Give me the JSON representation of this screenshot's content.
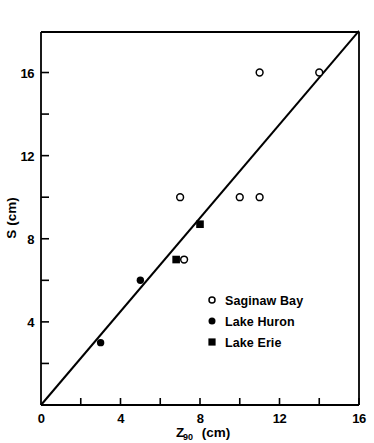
{
  "chart_data": {
    "type": "scatter",
    "title": "",
    "xlabel": "Z90 (cm)",
    "xlabel_main": "Z",
    "xlabel_sub": "90",
    "xlabel_unit": "(cm)",
    "ylabel": "S (cm)",
    "xlim": [
      0,
      16
    ],
    "ylim": [
      0,
      18
    ],
    "xticks_major": [
      0,
      4,
      8,
      12,
      16
    ],
    "xticks_minor": [
      2,
      6,
      10,
      14
    ],
    "xtick_labels": [
      "0",
      "4",
      "8",
      "12",
      "16"
    ],
    "yticks_major": [
      4,
      8,
      12,
      16
    ],
    "yticks_minor": [
      2,
      6,
      10,
      14,
      18
    ],
    "ytick_labels": [
      "4",
      "8",
      "12",
      "16"
    ],
    "grid": false,
    "legend_position": "inside-lower-right",
    "reference_line": {
      "name": "1:1 line",
      "x_start": 0,
      "y_start": 0,
      "x_end": 16,
      "y_end": 18
    },
    "series": [
      {
        "name": "Saginaw Bay",
        "marker": "open-circle",
        "color": "#000000",
        "points": [
          {
            "x": 7,
            "y": 10
          },
          {
            "x": 7.2,
            "y": 7
          },
          {
            "x": 10,
            "y": 10
          },
          {
            "x": 11,
            "y": 10
          },
          {
            "x": 11,
            "y": 16
          },
          {
            "x": 14,
            "y": 16
          }
        ]
      },
      {
        "name": "Lake Huron",
        "marker": "filled-circle",
        "color": "#000000",
        "points": [
          {
            "x": 3,
            "y": 3
          },
          {
            "x": 5,
            "y": 6
          }
        ]
      },
      {
        "name": "Lake Erie",
        "marker": "filled-square",
        "color": "#000000",
        "points": [
          {
            "x": 6.8,
            "y": 7
          },
          {
            "x": 8,
            "y": 8.7
          }
        ]
      }
    ]
  },
  "legend": {
    "items": [
      {
        "label": "Saginaw Bay",
        "marker": "open-circle"
      },
      {
        "label": "Lake  Huron",
        "marker": "filled-circle"
      },
      {
        "label": "Lake Erie",
        "marker": "filled-square"
      }
    ]
  },
  "axes": {
    "y_title": "S (cm)",
    "x_title_main": "Z",
    "x_title_sub": "90",
    "x_title_unit": "(cm)"
  }
}
